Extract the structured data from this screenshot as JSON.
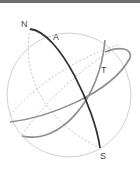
{
  "diagram": {
    "type": "celestial-sphere",
    "labels": {
      "north": "N",
      "south": "S",
      "great_circle_a": "A",
      "great_circle_t": "T"
    },
    "colors": {
      "sphere_outline": "#c8c8c8",
      "axis_circle": "#333333",
      "other_circles": "#9a9a9a",
      "hidden_lines": "#aaaaaa",
      "top_bar": "#6e6e6e"
    }
  }
}
